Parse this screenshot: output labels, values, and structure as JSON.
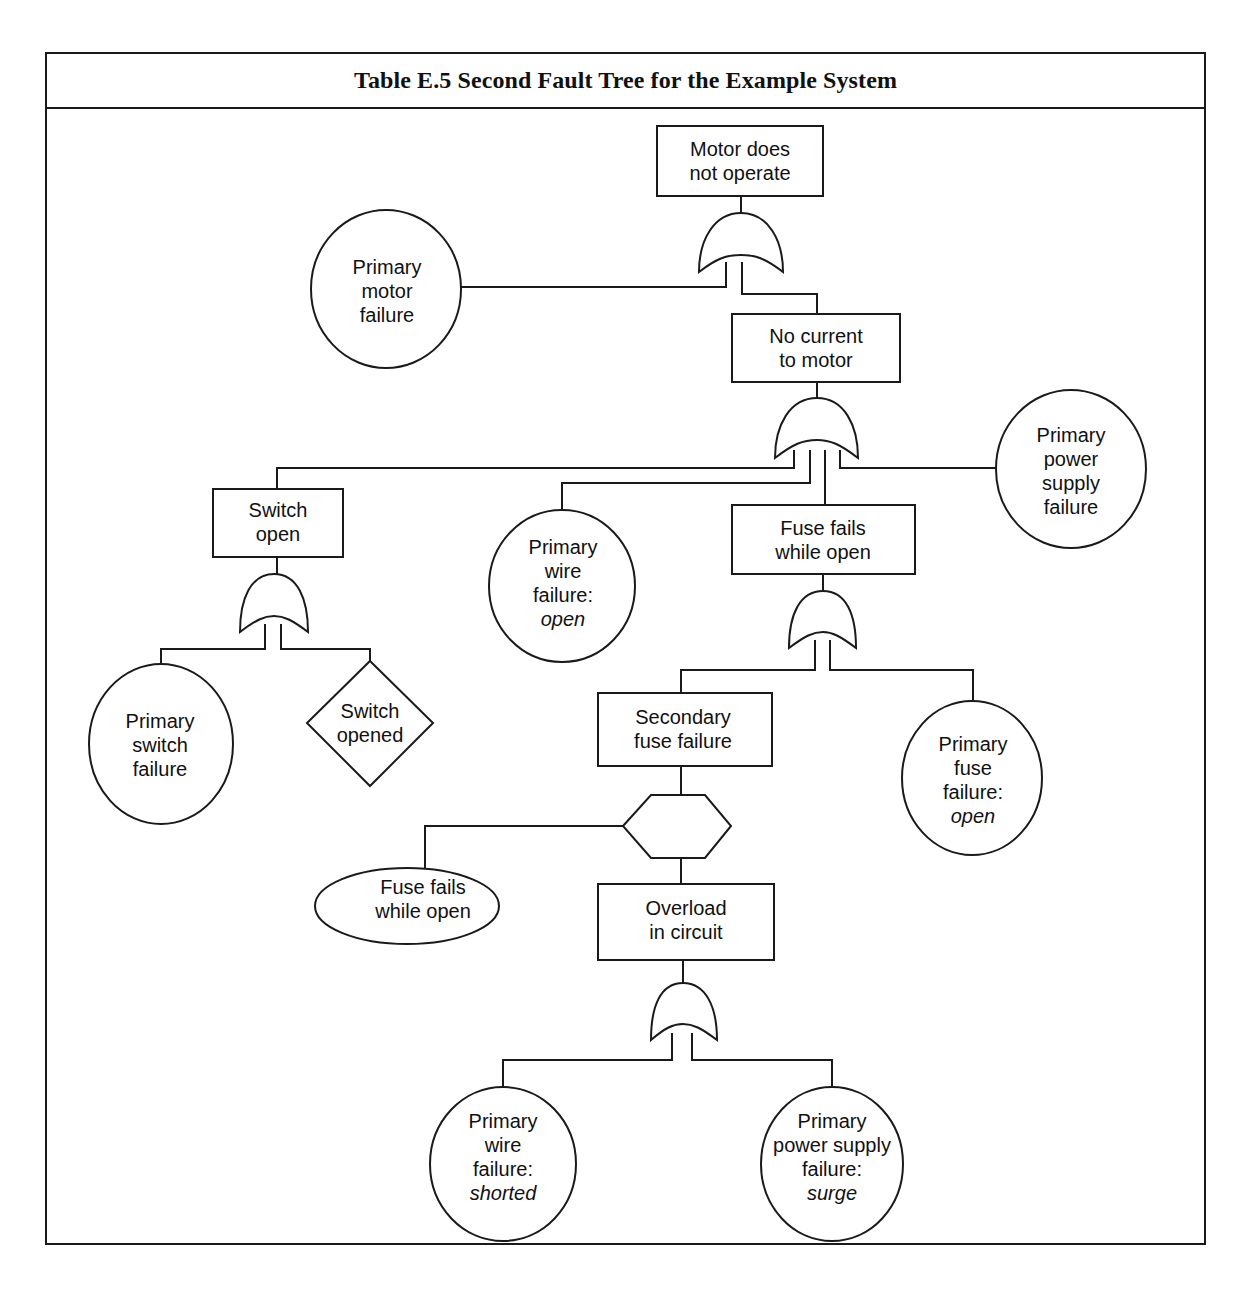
{
  "header": {
    "title": "Table E.5   Second Fault Tree for the Example System"
  },
  "nodes": {
    "top_event": {
      "type": "rectangle",
      "lines": [
        "Motor does",
        "not operate"
      ]
    },
    "primary_motor_failure": {
      "type": "circle",
      "lines": [
        "Primary",
        "motor",
        "failure"
      ]
    },
    "no_current": {
      "type": "rectangle",
      "lines": [
        "No current",
        "to motor"
      ]
    },
    "primary_power_supply_failure": {
      "type": "circle",
      "lines": [
        "Primary",
        "power",
        "supply",
        "failure"
      ]
    },
    "switch_open": {
      "type": "rectangle",
      "lines": [
        "Switch",
        "open"
      ]
    },
    "primary_wire_failure_open": {
      "type": "circle",
      "lines": [
        "Primary",
        "wire",
        "failure:"
      ],
      "italic_line": "open"
    },
    "fuse_fails_while_open": {
      "type": "rectangle",
      "lines": [
        "Fuse fails",
        "while open"
      ]
    },
    "primary_switch_failure": {
      "type": "circle",
      "lines": [
        "Primary",
        "switch",
        "failure"
      ]
    },
    "switch_opened": {
      "type": "diamond",
      "lines": [
        "Switch",
        "opened"
      ]
    },
    "secondary_fuse_failure": {
      "type": "rectangle",
      "lines": [
        "Secondary",
        "fuse failure"
      ]
    },
    "primary_fuse_failure_open": {
      "type": "circle",
      "lines": [
        "Primary",
        "fuse",
        "failure:"
      ],
      "italic_line": "open"
    },
    "inhibit_condition": {
      "type": "ellipse",
      "lines": [
        "Fuse fails",
        "while open"
      ]
    },
    "overload_in_circuit": {
      "type": "rectangle",
      "lines": [
        "Overload",
        "in circuit"
      ]
    },
    "primary_wire_failure_shorted": {
      "type": "circle",
      "lines": [
        "Primary",
        "wire",
        "failure:"
      ],
      "italic_line": "shorted"
    },
    "primary_power_supply_failure_surge": {
      "type": "circle",
      "lines": [
        "Primary",
        "power supply",
        "failure:"
      ],
      "italic_line": "surge"
    }
  },
  "gates": [
    {
      "id": "or-gate-1",
      "type": "OR",
      "output": "top_event",
      "inputs": [
        "primary_motor_failure",
        "no_current"
      ]
    },
    {
      "id": "or-gate-2",
      "type": "OR",
      "output": "no_current",
      "inputs": [
        "switch_open",
        "primary_wire_failure_open",
        "fuse_fails_while_open",
        "primary_power_supply_failure"
      ]
    },
    {
      "id": "or-gate-3",
      "type": "OR",
      "output": "fuse_fails_while_open",
      "inputs": [
        "secondary_fuse_failure",
        "primary_fuse_failure_open"
      ]
    },
    {
      "id": "or-gate-4",
      "type": "OR",
      "output": "switch_open",
      "inputs": [
        "primary_switch_failure",
        "switch_opened"
      ]
    },
    {
      "id": "inhibit-gate",
      "type": "INHIBIT",
      "output": "secondary_fuse_failure",
      "inputs": [
        "overload_in_circuit"
      ],
      "condition": "inhibit_condition"
    },
    {
      "id": "or-gate-5",
      "type": "OR",
      "output": "overload_in_circuit",
      "inputs": [
        "primary_wire_failure_shorted",
        "primary_power_supply_failure_surge"
      ]
    }
  ]
}
